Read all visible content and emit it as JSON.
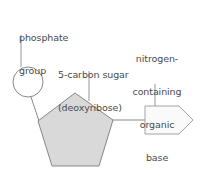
{
  "diagram": {
    "parts": [
      {
        "id": "phosphate",
        "label_lines": [
          "phosphate",
          "group"
        ],
        "shape": "circle"
      },
      {
        "id": "sugar",
        "label_lines": [
          "5-carbon sugar",
          "(deoxyribose)"
        ],
        "shape": "pentagon"
      },
      {
        "id": "base",
        "label_lines": [
          "nitrogen-",
          "containing",
          "organic",
          "base"
        ],
        "shape": "arrow-pentagon"
      }
    ],
    "colors": {
      "stroke": "#7a7a7a",
      "leader": "#8a8a8a",
      "sugar_fill": "#d9d9d9",
      "base_fill": "#fafafa",
      "phosphate_fill": "#ffffff",
      "text": "#4a4a4a"
    }
  }
}
